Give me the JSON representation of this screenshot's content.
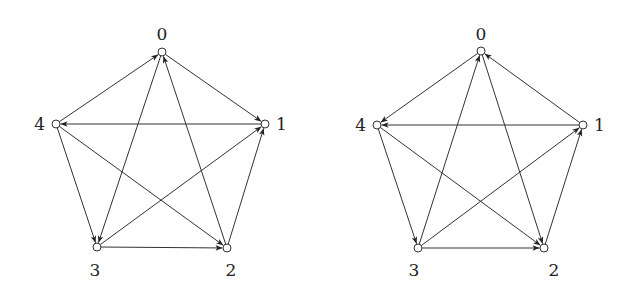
{
  "graphs": [
    {
      "name": "tournament-left",
      "nodes": [
        {
          "id": "0",
          "x": 162,
          "y": 52,
          "lx": 162,
          "ly": 40,
          "anchor": "middle"
        },
        {
          "id": "1",
          "x": 265,
          "y": 124,
          "lx": 276,
          "ly": 130,
          "anchor": "start"
        },
        {
          "id": "2",
          "x": 227,
          "y": 248,
          "lx": 231,
          "ly": 276,
          "anchor": "middle"
        },
        {
          "id": "3",
          "x": 97,
          "y": 247,
          "lx": 95,
          "ly": 276,
          "anchor": "middle"
        },
        {
          "id": "4",
          "x": 56,
          "y": 124,
          "lx": 45,
          "ly": 130,
          "anchor": "end"
        }
      ],
      "edges": [
        [
          "4",
          "0"
        ],
        [
          "0",
          "1"
        ],
        [
          "1",
          "4"
        ],
        [
          "0",
          "3"
        ],
        [
          "2",
          "0"
        ],
        [
          "4",
          "3"
        ],
        [
          "4",
          "2"
        ],
        [
          "3",
          "1"
        ],
        [
          "3",
          "2"
        ],
        [
          "2",
          "1"
        ]
      ]
    },
    {
      "name": "tournament-right",
      "nodes": [
        {
          "id": "0",
          "x": 481,
          "y": 51,
          "lx": 481,
          "ly": 40,
          "anchor": "middle"
        },
        {
          "id": "1",
          "x": 583,
          "y": 125,
          "lx": 594,
          "ly": 131,
          "anchor": "start"
        },
        {
          "id": "2",
          "x": 544,
          "y": 248,
          "lx": 554,
          "ly": 276,
          "anchor": "middle"
        },
        {
          "id": "3",
          "x": 418,
          "y": 248,
          "lx": 414,
          "ly": 276,
          "anchor": "middle"
        },
        {
          "id": "4",
          "x": 377,
          "y": 125,
          "lx": 366,
          "ly": 131,
          "anchor": "end"
        }
      ],
      "edges": [
        [
          "0",
          "4"
        ],
        [
          "1",
          "0"
        ],
        [
          "1",
          "4"
        ],
        [
          "3",
          "0"
        ],
        [
          "0",
          "2"
        ],
        [
          "4",
          "3"
        ],
        [
          "4",
          "2"
        ],
        [
          "3",
          "1"
        ],
        [
          "3",
          "2"
        ],
        [
          "2",
          "1"
        ]
      ]
    }
  ]
}
